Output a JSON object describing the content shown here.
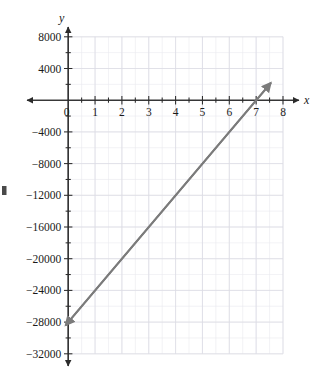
{
  "chart_data": {
    "type": "line",
    "title": "",
    "subtitle": "",
    "xlabel": "x",
    "ylabel": "y",
    "xlim": [
      0,
      8
    ],
    "ylim": [
      -32000,
      8000
    ],
    "grid": true,
    "legend": null,
    "x_ticks": [
      0,
      1,
      2,
      3,
      4,
      5,
      6,
      7,
      8
    ],
    "x_tick_labels": [
      "0",
      "1",
      "2",
      "3",
      "4",
      "5",
      "6",
      "7",
      "8"
    ],
    "y_ticks": [
      8000,
      4000,
      0,
      -4000,
      -8000,
      -12000,
      -16000,
      -20000,
      -24000,
      -28000,
      -32000
    ],
    "y_tick_labels": [
      "8000",
      "4000",
      "",
      "−4000",
      "−8000",
      "−12000",
      "−16000",
      "−20000",
      "−24000",
      "−28000",
      "−32000"
    ],
    "x_minor_step": 0.5,
    "y_minor_step": 2000,
    "series": [
      {
        "name": "line",
        "color": "#7b7b7b",
        "slope": 4000,
        "intercept": -28000,
        "x_intercept": 7,
        "arrows": "both",
        "points": [
          {
            "x": -0.1,
            "y": -28400
          },
          {
            "x": 7.55,
            "y": 2200
          }
        ],
        "reference_points": [
          {
            "x": 0,
            "y": -28000
          },
          {
            "x": 1,
            "y": -24000
          },
          {
            "x": 2,
            "y": -20000
          },
          {
            "x": 3,
            "y": -16000
          },
          {
            "x": 4,
            "y": -12000
          },
          {
            "x": 5,
            "y": -8000
          },
          {
            "x": 6,
            "y": -4000
          },
          {
            "x": 7,
            "y": 0
          },
          {
            "x": 7.5,
            "y": 2000
          }
        ]
      }
    ],
    "annotations": [],
    "axis_arrows": {
      "x_left": true,
      "x_right": true,
      "y_top": true,
      "y_bottom": true
    },
    "colors": {
      "line": "#7b7b7b",
      "axis": "#2b2b2b",
      "grid_major": "#dcdce4",
      "grid_minor": "#e9e9ef",
      "text": "#1a1a1a",
      "background": "#ffffff"
    }
  },
  "axis": {
    "x_name": "x",
    "y_name": "y",
    "origin_label": "0"
  }
}
